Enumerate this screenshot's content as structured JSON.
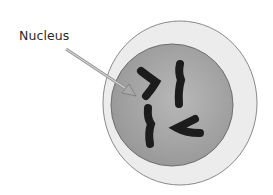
{
  "diagram": {
    "type": "cell-with-nucleus",
    "labels": [
      {
        "text": "Nucleus",
        "points_to": "nucleus"
      }
    ],
    "parts": {
      "cell": {
        "color": "#ededed",
        "outline": "#8a8a8a"
      },
      "nucleus": {
        "color": "#a8a8a8",
        "outline": "#6a6a6a"
      },
      "chromosomes": {
        "count": 5,
        "color": "#1c1c1c"
      },
      "arrow": {
        "color": "#9a9a9a"
      }
    }
  }
}
